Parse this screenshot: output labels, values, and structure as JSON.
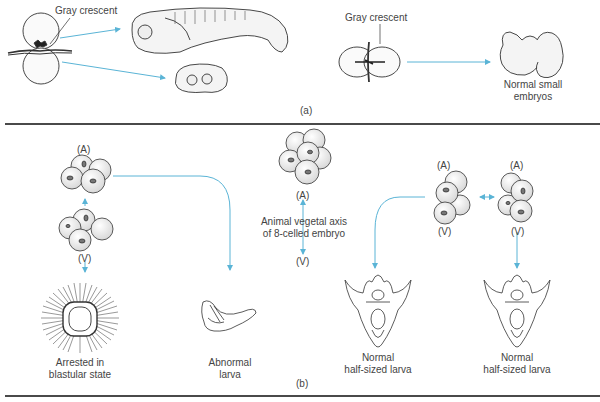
{
  "panel_a": {
    "panel_label": "(a)",
    "left_experiment": {
      "label": "Gray crescent",
      "outcomes": [
        "normal embryo (upper)",
        "abnormal mass (lower)"
      ]
    },
    "right_experiment": {
      "label": "Gray crescent",
      "outcome_line1": "Normal small",
      "outcome_line2": "embryos"
    }
  },
  "panel_b": {
    "panel_label": "(b)",
    "left_embryo": {
      "top_pole": "(A)",
      "bottom_pole": "(V)",
      "outcome1_line1": "Arrested in",
      "outcome1_line2": "blastular state",
      "outcome2_line1": "Abnormal",
      "outcome2_line2": "larva"
    },
    "center_embryo": {
      "top_pole": "(A)",
      "bottom_pole": "(V)",
      "axis_line1": "Animal vegetal axis",
      "axis_line2": "of 8-celled embryo"
    },
    "right_embryos": {
      "left_top_pole": "(A)",
      "left_bottom_pole": "(V)",
      "right_top_pole": "(A)",
      "right_bottom_pole": "(V)",
      "outcome1_line1": "Normal",
      "outcome1_line2": "half-sized larva",
      "outcome2_line1": "Normal",
      "outcome2_line2": "half-sized larva"
    }
  },
  "colors": {
    "arrow": "#5ab4d6",
    "line": "#333333",
    "divider": "#4a4a4a"
  }
}
